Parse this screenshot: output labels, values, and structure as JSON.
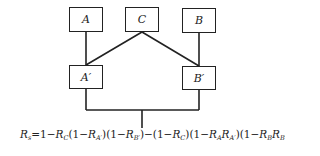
{
  "diagram": {
    "type": "reliability-block-diagram",
    "nodes": [
      {
        "id": "A",
        "label": "A"
      },
      {
        "id": "C",
        "label": "C"
      },
      {
        "id": "B",
        "label": "B"
      },
      {
        "id": "A_prime",
        "label": "A′"
      },
      {
        "id": "B_prime",
        "label": "B′"
      }
    ],
    "edges": [
      [
        "A",
        "A_prime"
      ],
      [
        "C",
        "A_prime"
      ],
      [
        "C",
        "B_prime"
      ],
      [
        "B",
        "B_prime"
      ],
      [
        "A_prime",
        "output"
      ],
      [
        "B_prime",
        "output"
      ]
    ]
  },
  "equation": {
    "lhs": "R",
    "lhs_sub": "s",
    "text": "Rs = 1 − RC(1 − RA′)(1 − RB′) − (1 − RC)(1 − RA RA′)(1 − RB RB′)"
  }
}
